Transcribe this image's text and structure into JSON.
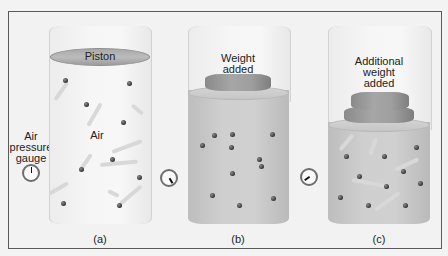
{
  "figure": {
    "panels": [
      {
        "id": "a",
        "caption": "(a)",
        "top_label": "Piston",
        "state": "piston only",
        "gauge_reading": "low"
      },
      {
        "id": "b",
        "caption": "(b)",
        "top_label": "Weight\nadded",
        "state": "one weight",
        "gauge_reading": "medium"
      },
      {
        "id": "c",
        "caption": "(c)",
        "top_label": "Additional\nweight\nadded",
        "state": "two weights",
        "gauge_reading": "high"
      }
    ],
    "gas_label": "Air",
    "gauge_label": "Air\npressure\ngauge",
    "colors": {
      "frame_border": "#5a5a5a",
      "gas_fill": "#c8c8c8",
      "piston": "#a8a8a8",
      "weight": "#9a9a9a",
      "molecule": "#333333"
    }
  }
}
